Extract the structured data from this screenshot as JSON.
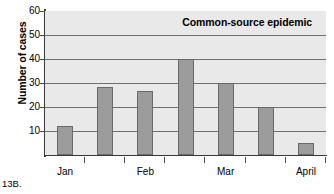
{
  "caption": "13B.",
  "chart_data": {
    "type": "bar",
    "title": "Common-source epidemic",
    "xlabel": "",
    "ylabel": "Number of cases",
    "ylim": [
      0,
      60
    ],
    "yticks": [
      10,
      20,
      30,
      40,
      50,
      60
    ],
    "grid": true,
    "legend": null,
    "categories": [
      "Jan",
      "",
      "Feb",
      "",
      "Mar",
      "",
      "April"
    ],
    "x_tick_labels": [
      "Jan",
      "Feb",
      "Mar",
      "April"
    ],
    "values": [
      12,
      28.5,
      26.5,
      40,
      30,
      20,
      5
    ],
    "bars": [
      {
        "label": "Jan",
        "value": 12
      },
      {
        "label": "",
        "value": 28.5
      },
      {
        "label": "Feb",
        "value": 26.5
      },
      {
        "label": "",
        "value": 40
      },
      {
        "label": "Mar",
        "value": 30
      },
      {
        "label": "",
        "value": 20
      },
      {
        "label": "April",
        "value": 5
      }
    ],
    "colors": {
      "bar_fill": "#9c9c9c",
      "bar_border": "#6a6a6a",
      "plot_background": "#e9e9e9",
      "gridline": "#6e6e6e",
      "axis": "#3a3a3a",
      "page_background": "#ffffff",
      "text": "#000000"
    }
  }
}
